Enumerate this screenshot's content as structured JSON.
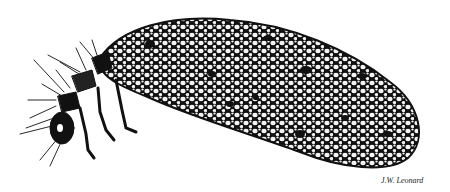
{
  "illustration": {
    "subject": "case-bearing insect larva",
    "style": "black-and-white ink stipple drawing",
    "signature": "J.W. Leonard"
  },
  "colors": {
    "ink": "#111111",
    "paper": "#ffffff",
    "cell": "#f4f4f4"
  }
}
